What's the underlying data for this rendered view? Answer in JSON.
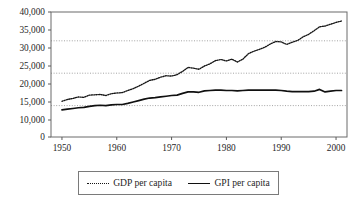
{
  "chart_data": {
    "type": "line",
    "title": "",
    "subtitle": "",
    "xlabel": "",
    "ylabel": "",
    "xlim": [
      1948,
      2002
    ],
    "ylim": [
      0,
      40000
    ],
    "grid": true,
    "gridlines_y": [
      32000,
      23000,
      14000
    ],
    "legend_position": "bottom",
    "y_ticks": [
      0,
      10000,
      15000,
      20000,
      25000,
      30000,
      35000,
      40000
    ],
    "y_tick_labels": [
      "0",
      "10,000",
      "15,000",
      "20,000",
      "25,000",
      "30,000",
      "35,000",
      "40,000"
    ],
    "x_ticks": [
      1950,
      1960,
      1970,
      1980,
      1990,
      2000
    ],
    "x_tick_labels": [
      "1950",
      "1960",
      "1970",
      "1980",
      "1990",
      "2000"
    ],
    "x": [
      1950,
      1951,
      1952,
      1953,
      1954,
      1955,
      1956,
      1957,
      1958,
      1959,
      1960,
      1961,
      1962,
      1963,
      1964,
      1965,
      1966,
      1967,
      1968,
      1969,
      1970,
      1971,
      1972,
      1973,
      1974,
      1975,
      1976,
      1977,
      1978,
      1979,
      1980,
      1981,
      1982,
      1983,
      1984,
      1985,
      1986,
      1987,
      1988,
      1989,
      1990,
      1991,
      1992,
      1993,
      1994,
      1995,
      1996,
      1997,
      1998,
      1999,
      2000,
      2001
    ],
    "series": [
      {
        "name": "GDP per capita",
        "style": "dotted",
        "color": "#161616",
        "values": [
          15200,
          15700,
          16000,
          16400,
          16300,
          16900,
          17000,
          17100,
          16800,
          17300,
          17500,
          17600,
          18200,
          18700,
          19400,
          20200,
          21000,
          21300,
          21900,
          22300,
          22200,
          22600,
          23500,
          24600,
          24400,
          24100,
          25000,
          25600,
          26500,
          26800,
          26400,
          26900,
          26100,
          26900,
          28400,
          29100,
          29600,
          30200,
          31100,
          31800,
          31700,
          31000,
          31600,
          32100,
          33100,
          33800,
          34800,
          35900,
          36100,
          36600,
          37100,
          37500
        ]
      },
      {
        "name": "GPI per capita",
        "style": "solid",
        "color": "#101010",
        "values": [
          12800,
          13000,
          13200,
          13400,
          13500,
          13800,
          14000,
          14100,
          14000,
          14200,
          14300,
          14300,
          14600,
          15000,
          15400,
          15800,
          16100,
          16200,
          16400,
          16600,
          16800,
          16900,
          17400,
          17800,
          17800,
          17700,
          18100,
          18200,
          18300,
          18300,
          18200,
          18200,
          18100,
          18200,
          18300,
          18300,
          18300,
          18300,
          18300,
          18300,
          18200,
          18000,
          17900,
          17900,
          17900,
          17900,
          18000,
          18500,
          17800,
          18000,
          18200,
          18200
        ]
      }
    ],
    "legend": [
      {
        "label": "GDP per capita",
        "style": "dotted"
      },
      {
        "label": "GPI per capita",
        "style": "solid"
      }
    ]
  }
}
